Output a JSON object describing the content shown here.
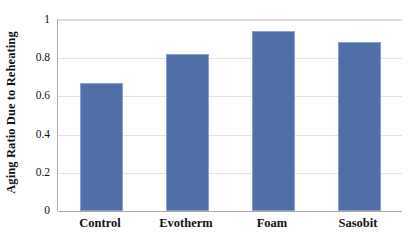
{
  "chart_data": {
    "type": "bar",
    "title": "",
    "subtitle": "",
    "xlabel": "",
    "ylabel": "Aging Ratio Due to Reheating",
    "categories": [
      "Control",
      "Evotherm",
      "Foam",
      "Sasobit"
    ],
    "values": [
      0.67,
      0.82,
      0.945,
      0.885
    ],
    "series": [
      {
        "name": "Aging Ratio Due to Reheating",
        "values": [
          0.67,
          0.82,
          0.945,
          0.885
        ]
      }
    ],
    "ylim": [
      0,
      1
    ],
    "xlim": [
      0,
      4
    ],
    "y_ticks": [
      0,
      0.2,
      0.4,
      0.6,
      0.8,
      1
    ],
    "y_tick_labels": [
      "0",
      "0.2",
      "0.4",
      "0.6",
      "0.8",
      "1"
    ],
    "grid": "horizontal",
    "legend": "none",
    "legend_position": "none",
    "bar_color": "#4f6fa8",
    "bar_border_color": "#8aa0c6",
    "gridline_color": "#e2e2e2",
    "axis_color": "#a9a9a9",
    "background_color": "#ffffff",
    "annotations": []
  },
  "axes": {
    "y_title": "Aging Ratio Due to Reheating",
    "y_tick_labels": [
      "1",
      "0.8",
      "0.6",
      "0.4",
      "0.2",
      "0"
    ],
    "x_tick_labels": [
      "Control",
      "Evotherm",
      "Foam",
      "Sasobit"
    ]
  }
}
